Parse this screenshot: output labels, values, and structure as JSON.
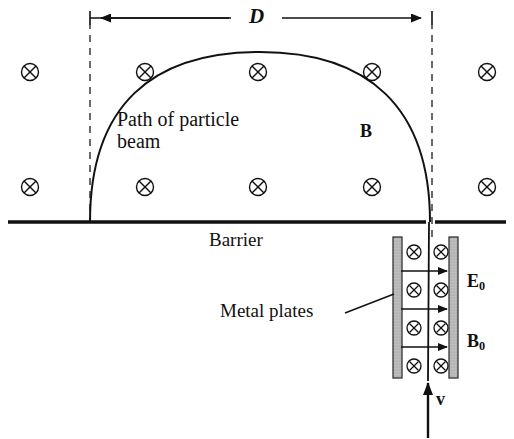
{
  "figure": {
    "width": 514,
    "height": 439,
    "background_color": "#ffffff",
    "line_color": "#111111",
    "plate_fill_color": "#b9b9b9"
  },
  "labels": {
    "dimension_D": "D",
    "path_of_particle_beam": "Path of particle\nbeam",
    "field_B": "B",
    "barrier": "Barrier",
    "metal_plates": "Metal plates",
    "field_E0_symbol": "E",
    "field_E0_sub": "0",
    "field_B0_symbol": "B",
    "field_B0_sub": "0",
    "velocity_v": "v"
  },
  "geometry": {
    "dimension_line": {
      "y": 18,
      "x_start": 90,
      "x_end": 432
    },
    "dashed_left": {
      "x": 90,
      "y_top": 20,
      "y_bottom": 222
    },
    "dashed_right": {
      "x": 432,
      "y_top": 20,
      "y_bottom": 237
    },
    "barrier_line": {
      "y": 222,
      "x_start": 8,
      "x_end": 506,
      "gap_start": 426,
      "gap_end": 434
    },
    "beam_arc": {
      "x_left": 90,
      "x_right": 430,
      "y_base": 222,
      "apex_x": 260,
      "apex_y": 52
    },
    "plate_left": {
      "x": 393,
      "y": 237,
      "width": 9,
      "height": 141
    },
    "plate_right": {
      "x": 449,
      "y": 237,
      "width": 9,
      "height": 141
    },
    "velocity_arrow": {
      "x": 428,
      "y_start": 438,
      "y_end": 379
    }
  },
  "field_symbols": {
    "glyph": "cross-in-circle",
    "meaning": "magnetic field into the page",
    "background_field": [
      {
        "x": 30,
        "y": 72
      },
      {
        "x": 145,
        "y": 72
      },
      {
        "x": 258,
        "y": 72
      },
      {
        "x": 372,
        "y": 72
      },
      {
        "x": 487,
        "y": 72
      },
      {
        "x": 30,
        "y": 187
      },
      {
        "x": 145,
        "y": 187
      },
      {
        "x": 258,
        "y": 187
      },
      {
        "x": 372,
        "y": 187
      },
      {
        "x": 487,
        "y": 187
      }
    ],
    "between_plates": [
      {
        "x": 414,
        "y": 252
      },
      {
        "x": 441,
        "y": 252
      },
      {
        "x": 414,
        "y": 290
      },
      {
        "x": 441,
        "y": 290
      },
      {
        "x": 414,
        "y": 328
      },
      {
        "x": 441,
        "y": 328
      },
      {
        "x": 414,
        "y": 366
      },
      {
        "x": 441,
        "y": 366
      }
    ]
  },
  "electric_field_arrows": [
    {
      "x_start": 401,
      "x_end": 449,
      "y": 271
    },
    {
      "x_start": 401,
      "x_end": 449,
      "y": 309
    },
    {
      "x_start": 401,
      "x_end": 449,
      "y": 347
    }
  ],
  "leader_line": {
    "name": "metal-plates-leader",
    "x_start": 345,
    "y_start": 313,
    "x_end": 394,
    "y_end": 294
  }
}
